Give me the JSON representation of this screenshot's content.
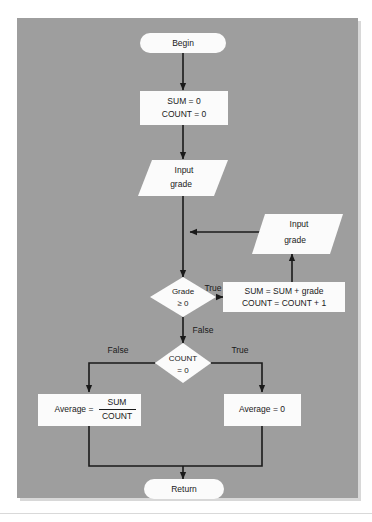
{
  "diagram": {
    "background_color": "#9e9e9e",
    "shape_fill": "#fbfbfb",
    "line_color": "#1a1a1a",
    "page_background": "#ffffff"
  },
  "nodes": {
    "begin": {
      "label": "Begin",
      "shape": "terminal"
    },
    "init": {
      "line1": "SUM = 0",
      "line2": "COUNT = 0",
      "shape": "process"
    },
    "input_first": {
      "line1": "Input",
      "line2": "grade",
      "shape": "input-output"
    },
    "input_loop": {
      "line1": "Input",
      "line2": "grade",
      "shape": "input-output"
    },
    "grade_test": {
      "line1": "Grade",
      "line2": "≥ 0",
      "shape": "decision"
    },
    "accumulate": {
      "line1": "SUM = SUM + grade",
      "line2": "COUNT = COUNT + 1",
      "shape": "process"
    },
    "count_test": {
      "line1": "COUNT",
      "line2": "= 0",
      "shape": "decision"
    },
    "average_div": {
      "prefix": "Average =",
      "numerator": "SUM",
      "denominator": "COUNT",
      "shape": "process"
    },
    "average_zero": {
      "label": "Average = 0",
      "shape": "process"
    },
    "return": {
      "label": "Return",
      "shape": "terminal"
    }
  },
  "edge_labels": {
    "grade_true": "True",
    "grade_false": "False",
    "count_false": "False",
    "count_true": "True"
  }
}
